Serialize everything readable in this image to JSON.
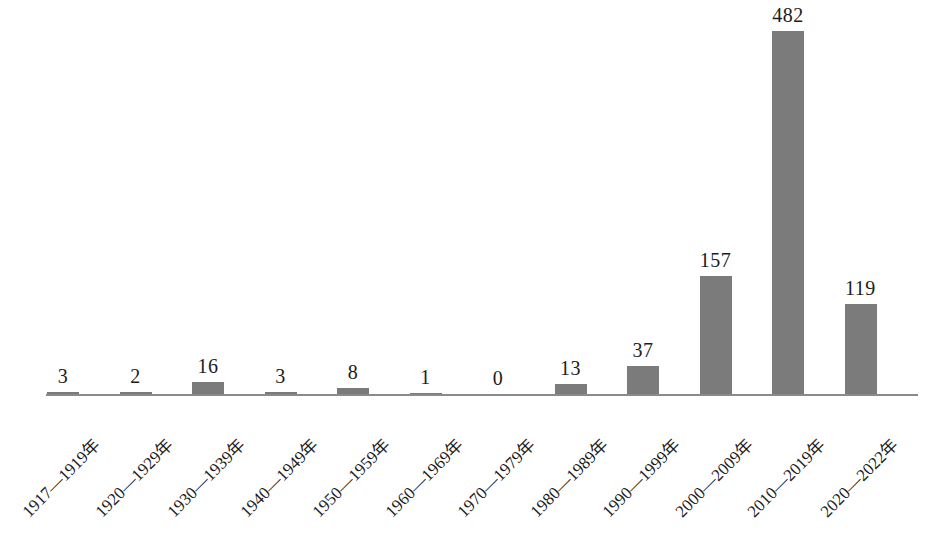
{
  "chart_data": {
    "type": "bar",
    "title": "",
    "subtitle": "",
    "xlabel": "",
    "ylabel": "",
    "ylim": [
      0,
      482
    ],
    "grid": false,
    "legend": null,
    "bar_color": "#7b7b7b",
    "axis_color": "#8a8a8a",
    "text_color": "#1c1c1c",
    "categories": [
      "1917—1919年",
      "1920—1929年",
      "1930—1939年",
      "1940—1949年",
      "1950—1959年",
      "1960—1969年",
      "1970—1979年",
      "1980—1989年",
      "1990—1999年",
      "2000—2009年",
      "2010—2019年",
      "2020—2022年"
    ],
    "values": [
      3,
      2,
      16,
      3,
      8,
      1,
      0,
      13,
      37,
      157,
      482,
      119
    ],
    "value_labels": [
      "3",
      "2",
      "16",
      "3",
      "8",
      "1",
      "0",
      "13",
      "37",
      "157",
      "482",
      "119"
    ],
    "annotations": []
  },
  "caption": {
    "text": ""
  }
}
